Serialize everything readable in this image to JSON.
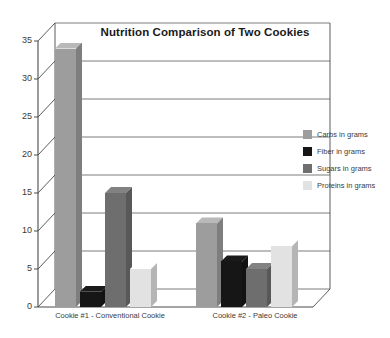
{
  "chart_data": {
    "type": "bar",
    "title": "Nutrition Comparison of Two Cookies",
    "xlabel": "",
    "ylabel": "",
    "ylim": [
      0,
      35
    ],
    "yticks": [
      "0",
      "5",
      "10",
      "15",
      "20",
      "25",
      "30",
      "35"
    ],
    "grid": true,
    "legend_position": "right",
    "style": "3d-clustered-column",
    "categories": [
      "Cookie #1 - Conventional Cookie",
      "Cookie #2 - Paleo Cookie"
    ],
    "series": [
      {
        "name": "Carbs in grams",
        "values": [
          34,
          11
        ],
        "color": "#9d9d9d"
      },
      {
        "name": "Fiber in grams",
        "values": [
          2,
          6
        ],
        "color": "#161616"
      },
      {
        "name": "Sugars in grams",
        "values": [
          15,
          5
        ],
        "color": "#6e6e6e"
      },
      {
        "name": "Proteins in grams",
        "values": [
          5,
          8
        ],
        "color": "#e2e2e2"
      }
    ]
  },
  "legend": {
    "items": [
      {
        "label": "Carbs in grams"
      },
      {
        "label": "Fiber in grams"
      },
      {
        "label": "Sugars in grams"
      },
      {
        "label": "Proteins in grams"
      }
    ]
  },
  "axis": {
    "y_ticks": [
      "35",
      "30",
      "25",
      "20",
      "15",
      "10",
      "5",
      "0"
    ],
    "x_labels": [
      "Cookie #1 - Conventional Cookie",
      "Cookie #2 - Paleo Cookie"
    ]
  },
  "colors": {
    "carbs": "#9d9d9d",
    "fiber": "#161616",
    "sugars": "#6e6e6e",
    "proteins": "#e2e2e2",
    "axis": "#4a4a4a",
    "grid": "#5a5a5a",
    "floor": "#ffffff",
    "text": "#3a3a3a"
  }
}
